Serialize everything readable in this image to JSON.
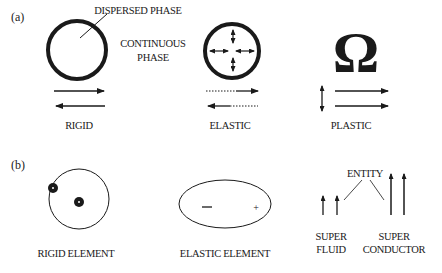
{
  "figure": {
    "panel_a": {
      "label": "(a)",
      "annotations": {
        "dispersed_phase": "DISPERSED PHASE",
        "continuous_phase_line1": "CONTINUOUS",
        "continuous_phase_line2": "PHASE"
      },
      "items": [
        {
          "name": "rigid",
          "label": "RIGID",
          "symbol": "thick-circle",
          "arrows": "solid-opposite"
        },
        {
          "name": "elastic",
          "label": "ELASTIC",
          "symbol": "circle-with-internal-double-arrows",
          "arrows": "dotted-opposite"
        },
        {
          "name": "plastic",
          "label": "PLASTIC",
          "symbol": "Ω",
          "arrows": "vertical-double-plus-parallel"
        }
      ]
    },
    "panel_b": {
      "label": "(b)",
      "items": [
        {
          "name": "rigid-element",
          "label": "RIGID ELEMENT"
        },
        {
          "name": "elastic-element",
          "label": "ELASTIC ELEMENT",
          "minus": "—",
          "plus": "+"
        },
        {
          "name": "super-fluid",
          "label_line1": "SUPER",
          "label_line2": "FLUID"
        },
        {
          "name": "super-conductor",
          "label_line1": "SUPER",
          "label_line2": "CONDUCTOR"
        }
      ],
      "entity_label": "ENTITY"
    },
    "colors": {
      "ink": "#1a1a1a",
      "background": "#ffffff"
    }
  }
}
